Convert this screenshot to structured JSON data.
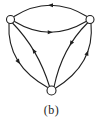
{
  "figure": {
    "caption": "(b)",
    "colors": {
      "background": "#ffffff",
      "stroke": "#1f1f1f",
      "node_fill": "#ffffff"
    },
    "graph": {
      "stroke_width": 1.1,
      "arrow_length": 5,
      "arrow_half_width": 2.1,
      "viewbox": "0 0 103 100",
      "nodes": [
        {
          "id": "top-left",
          "x": 10.5,
          "y": 19.5,
          "r": 4
        },
        {
          "id": "top-right",
          "x": 90,
          "y": 19.5,
          "r": 4
        },
        {
          "id": "bottom",
          "x": 51.5,
          "y": 90.5,
          "r": 4.5
        }
      ],
      "edges": [
        {
          "from": "top-right",
          "to": "top-left",
          "path": "M 87 16.5 Q 50 -6 14 16.5",
          "arrow_t": 0.5
        },
        {
          "from": "top-left",
          "to": "top-right",
          "path": "M 14.5 21.5 Q 50 43 86 21.5",
          "arrow_t": 0.5
        },
        {
          "from": "top-left",
          "to": "bottom",
          "path": "M 9 23.5 Q 6.5 65 48.5 88",
          "arrow_t": 0.5
        },
        {
          "from": "bottom",
          "to": "top-left",
          "path": "M 49.5 86.5 Q 38 49 12.5 23",
          "arrow_t": 0.53
        },
        {
          "from": "top-right",
          "to": "bottom",
          "path": "M 87.5 23 Q 62 48 54 87",
          "arrow_t": 0.36
        },
        {
          "from": "bottom",
          "to": "top-right",
          "path": "M 55 88.5 Q 95 64 91 23.5",
          "arrow_t": 0.62
        }
      ]
    }
  }
}
